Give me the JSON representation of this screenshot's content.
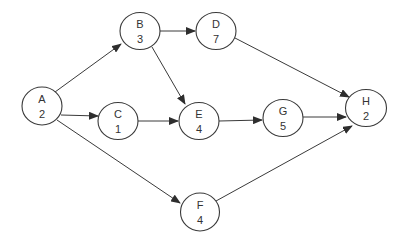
{
  "diagram": {
    "type": "activity-on-node network",
    "colors": {
      "line": "#3a3a3a",
      "text": "#333333",
      "background": "#ffffff"
    },
    "nodes": [
      {
        "id": "A",
        "label": "A",
        "duration": "2",
        "cx": 42,
        "cy": 106
      },
      {
        "id": "B",
        "label": "B",
        "duration": "3",
        "cx": 140,
        "cy": 31
      },
      {
        "id": "C",
        "label": "C",
        "duration": "1",
        "cx": 118,
        "cy": 121
      },
      {
        "id": "D",
        "label": "D",
        "duration": "7",
        "cx": 216,
        "cy": 31
      },
      {
        "id": "E",
        "label": "E",
        "duration": "4",
        "cx": 199,
        "cy": 121
      },
      {
        "id": "F",
        "label": "F",
        "duration": "4",
        "cx": 200,
        "cy": 212
      },
      {
        "id": "G",
        "label": "G",
        "duration": "5",
        "cx": 283,
        "cy": 118
      },
      {
        "id": "H",
        "label": "H",
        "duration": "2",
        "cx": 366,
        "cy": 108
      }
    ],
    "edges": [
      {
        "from": "A",
        "to": "B"
      },
      {
        "from": "A",
        "to": "C"
      },
      {
        "from": "A",
        "to": "F"
      },
      {
        "from": "B",
        "to": "D"
      },
      {
        "from": "B",
        "to": "E"
      },
      {
        "from": "C",
        "to": "E"
      },
      {
        "from": "D",
        "to": "H"
      },
      {
        "from": "E",
        "to": "G"
      },
      {
        "from": "G",
        "to": "H"
      },
      {
        "from": "F",
        "to": "H"
      }
    ]
  }
}
